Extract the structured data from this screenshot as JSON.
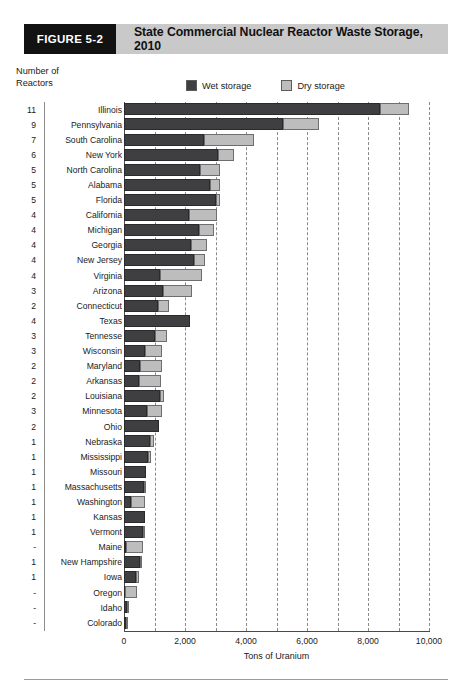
{
  "figure": {
    "tag": "FIGURE 5-2",
    "title": "State Commercial Nuclear Reactor Waste Storage, 2010",
    "tag_bg": "#121212",
    "header_bg": "#c9c9c9"
  },
  "yaxis_caption": {
    "line1": "Number of",
    "line2": "Reactors"
  },
  "legend": {
    "items": [
      {
        "label": "Wet storage",
        "color": "#3f3f42"
      },
      {
        "label": "Dry storage",
        "color": "#bdbdbd"
      }
    ]
  },
  "chart_data": {
    "type": "bar",
    "orientation": "horizontal",
    "stacked": true,
    "title": "State Commercial Nuclear Reactor Waste Storage, 2010",
    "xlabel": "Tons of Uranium",
    "ylabel": "Number of Reactors",
    "xlim": [
      0,
      10000
    ],
    "xticks": [
      0,
      2000,
      4000,
      6000,
      8000,
      10000
    ],
    "xtick_labels": [
      "0",
      "2,000",
      "4,000",
      "6,000",
      "8,000",
      "10,000"
    ],
    "gridlines_every": 1000,
    "grid": true,
    "legend_position": "top",
    "categories": [
      "Illinois",
      "Pennsylvania",
      "South Carolina",
      "New York",
      "North Carolina",
      "Alabama",
      "Florida",
      "California",
      "Michigan",
      "Georgia",
      "New Jersey",
      "Virginia",
      "Arizona",
      "Connecticut",
      "Texas",
      "Tennesse",
      "Wisconsin",
      "Maryland",
      "Arkansas",
      "Louisiana",
      "Minnesota",
      "Ohio",
      "Nebraska",
      "Mississippi",
      "Missouri",
      "Massachusetts",
      "Washington",
      "Kansas",
      "Vermont",
      "Maine",
      "New Hampshire",
      "Iowa",
      "Oregon",
      "Idaho",
      "Colorado"
    ],
    "reactor_counts": [
      "11",
      "9",
      "7",
      "6",
      "5",
      "5",
      "5",
      "4",
      "4",
      "4",
      "4",
      "4",
      "3",
      "2",
      "4",
      "3",
      "3",
      "2",
      "2",
      "2",
      "3",
      "2",
      "1",
      "1",
      "1",
      "1",
      "1",
      "1",
      "1",
      "-",
      "1",
      "1",
      "-",
      "-",
      "-"
    ],
    "series": [
      {
        "name": "Wet storage",
        "color": "#3f3f42",
        "values": [
          8400,
          5200,
          2620,
          3080,
          2480,
          2820,
          3020,
          2120,
          2460,
          2200,
          2300,
          1180,
          1280,
          1120,
          2160,
          1000,
          700,
          520,
          500,
          1180,
          760,
          1150,
          860,
          780,
          720,
          640,
          240,
          700,
          620,
          60,
          520,
          380,
          40,
          100,
          80
        ]
      },
      {
        "name": "Dry storage",
        "color": "#bdbdbd",
        "values": [
          950,
          1200,
          1630,
          520,
          680,
          340,
          140,
          940,
          480,
          520,
          340,
          1380,
          960,
          340,
          0,
          420,
          560,
          740,
          720,
          120,
          480,
          0,
          140,
          100,
          0,
          60,
          460,
          0,
          40,
          560,
          60,
          120,
          380,
          40,
          40
        ]
      }
    ],
    "totals": [
      9350,
      6400,
      4250,
      3600,
      3160,
      3160,
      3160,
      3060,
      2940,
      2720,
      2640,
      2560,
      2240,
      1460,
      2160,
      1420,
      1260,
      1260,
      1220,
      1300,
      1240,
      1150,
      1000,
      880,
      720,
      700,
      700,
      700,
      660,
      620,
      580,
      500,
      420,
      140,
      120
    ]
  }
}
